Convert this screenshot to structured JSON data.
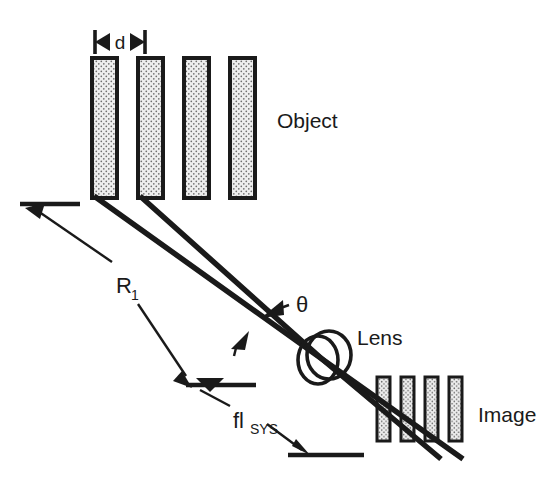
{
  "diagram": {
    "labels": {
      "object": "Object",
      "image": "Image",
      "lens": "Lens",
      "theta": "θ",
      "spacing": "d",
      "radius_main": "R",
      "radius_sub": "1",
      "focal_main": "fl",
      "focal_sub": "SYS"
    },
    "colors": {
      "ink": "#1a1a1a",
      "background": "#ffffff",
      "bar_fill": "#e8e8e8",
      "stipple_dot": "#707070"
    },
    "object_grating": {
      "bar_count": 4,
      "bar_width_px": 27,
      "bar_height_px": 142,
      "bar_left_px": [
        90,
        136,
        182,
        228
      ],
      "bar_top_px": 56,
      "pitch_label": "d"
    },
    "image_grating": {
      "bar_count": 4,
      "bar_width_px": 14,
      "bar_height_px": 65,
      "bar_left_px": [
        376,
        400,
        424,
        448
      ],
      "bar_top_px": 376
    },
    "lens": {
      "center_px": [
        322,
        359
      ],
      "radius_px": 23,
      "element_count": 2
    },
    "rays": {
      "count": 2,
      "origin_px": [
        [
          94,
          198
        ],
        [
          140,
          198
        ]
      ],
      "converge_px": [
        322,
        359
      ],
      "terminal_px": [
        [
          462,
          458
        ],
        [
          440,
          458
        ]
      ]
    },
    "dimensions": [
      {
        "name": "R1",
        "label": "R",
        "subscript": "1",
        "from_tick_px": [
          18,
          205
        ],
        "to_tick_px": [
          182,
          385
        ],
        "double_headed": true
      },
      {
        "name": "fl_SYS",
        "label": "fl",
        "subscript": "SYS",
        "from_tick_px": [
          182,
          385
        ],
        "to_tick_px": [
          295,
          452
        ],
        "double_headed": true
      }
    ],
    "annotations": [
      {
        "name": "theta-callout",
        "label": "θ",
        "points_to_px": [
          268,
          290
        ]
      }
    ]
  }
}
